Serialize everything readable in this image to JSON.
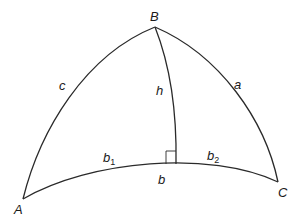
{
  "diagram": {
    "type": "spherical-triangle",
    "vertices": {
      "A": {
        "label": "A",
        "x": 23,
        "y": 199,
        "label_x": 14,
        "label_y": 214
      },
      "B": {
        "label": "B",
        "x": 155,
        "y": 27,
        "label_x": 150,
        "label_y": 21
      },
      "C": {
        "label": "C",
        "x": 278,
        "y": 182,
        "label_x": 278,
        "label_y": 197
      }
    },
    "sides": {
      "a": {
        "label": "a",
        "x": 234,
        "y": 89
      },
      "b": {
        "label": "b",
        "x": 158,
        "y": 184
      },
      "c": {
        "label": "c",
        "x": 59,
        "y": 90
      },
      "h": {
        "label": "h",
        "x": 156,
        "y": 95
      }
    },
    "segments": {
      "b1": {
        "label": "b",
        "sub": "1",
        "x": 103,
        "y": 162
      },
      "b2": {
        "label": "b",
        "sub": "2",
        "x": 207,
        "y": 160
      }
    },
    "foot": {
      "x": 176,
      "y": 164
    },
    "right_angle_marker": true,
    "stroke_color": "#2a2a2a"
  }
}
